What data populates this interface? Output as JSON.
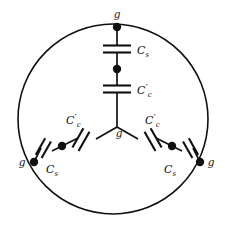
{
  "figure": {
    "geometry": {
      "width": 225,
      "height": 233,
      "circle_center_x": 113,
      "circle_center_y": 119,
      "circle_radius": 95
    },
    "colors": {
      "ink": "#101010",
      "background": "#ffffff"
    },
    "center_node": {
      "label": "g",
      "x": 117,
      "y": 127
    },
    "branches": [
      {
        "name": "top-branch",
        "terminal_label": "g",
        "terminal_x": 117,
        "terminal_y": 27,
        "mid_node_label": "",
        "mid_node_x": 117,
        "mid_node_y": 69,
        "inner_capacitor_label_base": "C",
        "inner_capacitor_label_prime": "′",
        "inner_capacitor_label_sub": "c",
        "outer_capacitor_label_base": "C",
        "outer_capacitor_label_sub": "s"
      },
      {
        "name": "lower-left-branch",
        "terminal_label": "g",
        "terminal_x": 34,
        "terminal_y": 162,
        "mid_node_label": "",
        "mid_node_x": 62,
        "mid_node_y": 146,
        "inner_capacitor_label_base": "C",
        "inner_capacitor_label_prime": "′",
        "inner_capacitor_label_sub": "c",
        "outer_capacitor_label_base": "C",
        "outer_capacitor_label_sub": "s"
      },
      {
        "name": "lower-right-branch",
        "terminal_label": "g",
        "terminal_x": 200,
        "terminal_y": 162,
        "mid_node_label": "",
        "mid_node_x": 172,
        "mid_node_y": 146,
        "inner_capacitor_label_base": "C",
        "inner_capacitor_label_prime": "′",
        "inner_capacitor_label_sub": "c",
        "outer_capacitor_label_base": "C",
        "outer_capacitor_label_sub": "s"
      }
    ],
    "labels": {
      "g_top": "g",
      "g_center": "g",
      "g_left": "g",
      "g_right": "g",
      "cs_top": "C",
      "cs_top_sub": "s",
      "cc_top": "C",
      "cc_top_prime": "′",
      "cc_top_sub": "c",
      "cc_left": "C",
      "cc_left_prime": "′",
      "cc_left_sub": "c",
      "cs_left": "C",
      "cs_left_sub": "s",
      "cc_right": "C",
      "cc_right_prime": "′",
      "cc_right_sub": "c",
      "cs_right": "C",
      "cs_right_sub": "s"
    }
  }
}
